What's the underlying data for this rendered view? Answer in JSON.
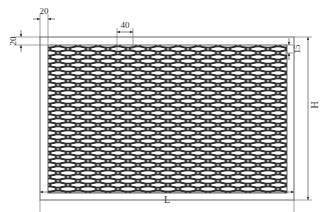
{
  "diagram": {
    "type": "expanded-metal-mesh-panel",
    "dimensions": {
      "frame_width_left": "20",
      "frame_width_top": "20",
      "mesh_pitch_horizontal": "40",
      "mesh_pitch_vertical": "15",
      "overall_length": "L",
      "overall_height": "H"
    },
    "colors": {
      "line": "#555555",
      "mesh": "#333333",
      "background": "#ffffff"
    }
  }
}
